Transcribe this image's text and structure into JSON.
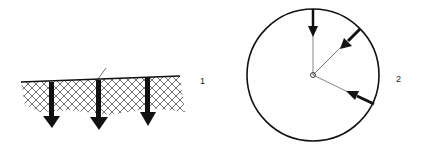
{
  "figure": {
    "panels": [
      {
        "label": "1",
        "description": "hatched ground surface with three downward arrows",
        "arrow_count": 3
      },
      {
        "label": "2",
        "description": "circle with three arrows pointing toward center",
        "arrow_count": 3
      }
    ],
    "colors": {
      "ink": "#111111",
      "background": "#ffffff"
    }
  }
}
